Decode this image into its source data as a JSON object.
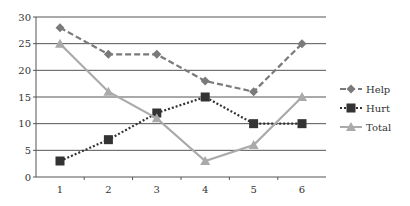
{
  "chart_data": {
    "type": "line",
    "title": "",
    "xlabel": "",
    "ylabel": "",
    "x": [
      1,
      2,
      3,
      4,
      5,
      6
    ],
    "categories": [
      "1",
      "2",
      "3",
      "4",
      "5",
      "6"
    ],
    "ylim": [
      0,
      30
    ],
    "yticks": [
      0,
      5,
      10,
      15,
      20,
      25,
      30
    ],
    "grid": "horizontal",
    "legend_position": "right",
    "series": [
      {
        "name": "Help",
        "values": [
          28,
          23,
          23,
          18,
          16,
          25
        ],
        "color": "#7a7a7a",
        "dash": "dashed",
        "marker": "diamond"
      },
      {
        "name": "Hurt",
        "values": [
          3,
          7,
          12,
          15,
          10,
          10
        ],
        "color": "#333333",
        "dash": "dotted",
        "marker": "square"
      },
      {
        "name": "Total",
        "values": [
          25,
          16,
          11,
          3,
          6,
          15
        ],
        "color": "#aaaaaa",
        "dash": "solid",
        "marker": "triangle"
      }
    ]
  },
  "colors": {
    "gridline": "#555555",
    "axis": "#555555",
    "text": "#333333"
  }
}
